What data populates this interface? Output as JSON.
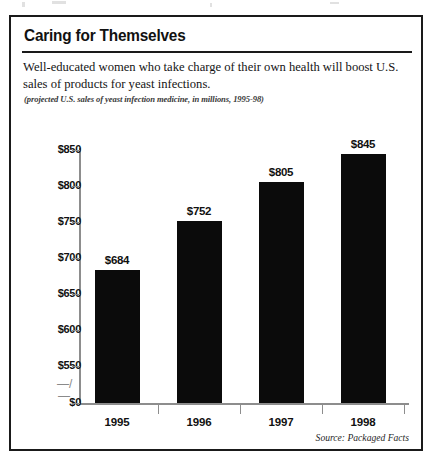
{
  "frame": {
    "title": "Caring for Themselves",
    "deck": "Well-educated women who take charge of their own health will boost U.S. sales of products for yeast infections.",
    "caption": "(projected U.S. sales of yeast infection medicine, in millions, 1995-98)",
    "source": "Source: Packaged Facts"
  },
  "axis_break_glyph": "—/—",
  "colors": {
    "bar": "#0b0b0b",
    "frame": "#1a1a1a",
    "axis": "#8d8d8d",
    "text": "#111111",
    "background": "#ffffff"
  },
  "chart_data": {
    "type": "bar",
    "title": "Caring for Themselves",
    "subtitle": "Well-educated women who take charge of their own health will boost U.S. sales of products for yeast infections.",
    "annotation": "(projected U.S. sales of yeast infection medicine, in millions, 1995-98)",
    "source": "Source: Packaged Facts",
    "categories": [
      "1995",
      "1996",
      "1997",
      "1998"
    ],
    "values": [
      684,
      752,
      805,
      845
    ],
    "data_labels": [
      "$684",
      "$752",
      "$805",
      "$845"
    ],
    "xlabel": "",
    "ylabel": "",
    "unit": "millions of U.S. dollars",
    "ylim": [
      0,
      850
    ],
    "yticks": [
      0,
      550,
      600,
      650,
      700,
      750,
      800,
      850
    ],
    "ytick_labels": [
      "$0",
      "$550",
      "$600",
      "$650",
      "$700",
      "$750",
      "$800",
      "$850"
    ],
    "axis_break": true,
    "axis_break_between": [
      0,
      550
    ],
    "grid": false,
    "legend": false
  }
}
